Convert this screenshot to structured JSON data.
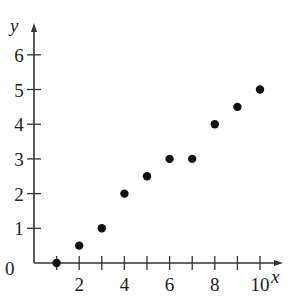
{
  "chart_data": {
    "type": "scatter",
    "title": "",
    "xlabel": "x",
    "ylabel": "y",
    "x": [
      1,
      2,
      3,
      4,
      5,
      6,
      7,
      8,
      9,
      10
    ],
    "y": [
      0,
      0.5,
      1,
      2,
      2.5,
      3,
      3,
      4,
      4.5,
      5
    ],
    "xlim": [
      0,
      11
    ],
    "ylim": [
      0,
      6.6
    ],
    "x_ticks": [
      1,
      2,
      3,
      4,
      5,
      6,
      7,
      8,
      9,
      10
    ],
    "x_tick_labels": [
      "2",
      "4",
      "6",
      "8",
      "10"
    ],
    "x_tick_label_values": [
      2,
      4,
      6,
      8,
      10
    ],
    "y_ticks": [
      1,
      2,
      3,
      4,
      5,
      6
    ],
    "y_tick_labels": [
      "1",
      "2",
      "3",
      "4",
      "5",
      "6"
    ],
    "origin_label": "0",
    "grid": false,
    "legend": null,
    "marker_color": "#111111",
    "axis_color": "#333333"
  }
}
